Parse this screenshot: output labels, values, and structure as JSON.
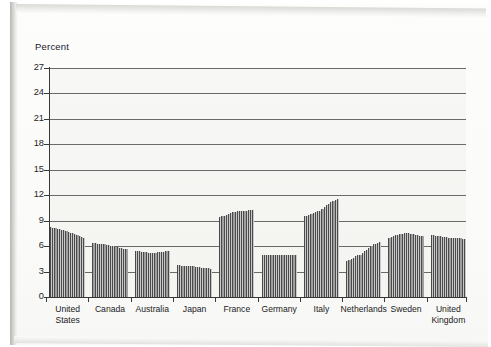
{
  "chart_data": {
    "type": "bar",
    "title": "",
    "subtitle": "",
    "xlabel": "",
    "ylabel": "Percent",
    "ylim": [
      0,
      27
    ],
    "yticks": [
      0,
      3,
      6,
      9,
      12,
      15,
      18,
      21,
      24,
      27
    ],
    "grid": true,
    "legend": false,
    "legend_position": "none",
    "note": "Grouped time-series bars: each country group is a run of thin bars showing a trend over consecutive periods.",
    "categories": [
      "United States",
      "Canada",
      "Australia",
      "Japan",
      "France",
      "Germany",
      "Italy",
      "Netherlands",
      "Sweden",
      "United Kingdom"
    ],
    "groups": [
      {
        "label": "United States",
        "values": [
          8.2,
          8.1,
          8.1,
          8.0,
          8.0,
          7.9,
          7.9,
          7.8,
          7.7,
          7.6,
          7.5,
          7.4,
          7.3,
          7.2,
          7.1,
          7.0
        ]
      },
      {
        "label": "Canada",
        "values": [
          6.4,
          6.4,
          6.3,
          6.3,
          6.2,
          6.2,
          6.1,
          6.1,
          6.0,
          6.0,
          5.9,
          5.9,
          5.8,
          5.8,
          5.7,
          5.7
        ]
      },
      {
        "label": "Australia",
        "values": [
          5.4,
          5.4,
          5.4,
          5.3,
          5.3,
          5.3,
          5.2,
          5.2,
          5.2,
          5.2,
          5.3,
          5.3,
          5.3,
          5.3,
          5.4,
          5.4
        ]
      },
      {
        "label": "Japan",
        "values": [
          3.8,
          3.8,
          3.7,
          3.7,
          3.7,
          3.6,
          3.6,
          3.6,
          3.5,
          3.5,
          3.5,
          3.4,
          3.4,
          3.4,
          3.4,
          3.3
        ]
      },
      {
        "label": "France",
        "values": [
          9.4,
          9.5,
          9.6,
          9.7,
          9.8,
          9.9,
          10.0,
          10.0,
          10.1,
          10.1,
          10.2,
          10.2,
          10.2,
          10.3,
          10.3,
          10.3
        ]
      },
      {
        "label": "Germany",
        "values": [
          5.0,
          5.0,
          5.0,
          5.0,
          5.0,
          5.0,
          5.0,
          5.0,
          5.0,
          5.0,
          5.0,
          5.0,
          5.0,
          5.0,
          5.0,
          5.0
        ]
      },
      {
        "label": "Italy",
        "values": [
          9.5,
          9.6,
          9.7,
          9.8,
          9.9,
          10.0,
          10.1,
          10.2,
          10.4,
          10.6,
          10.8,
          11.0,
          11.2,
          11.3,
          11.4,
          11.5
        ]
      },
      {
        "label": "Netherlands",
        "values": [
          4.3,
          4.4,
          4.5,
          4.6,
          4.8,
          4.9,
          5.0,
          5.2,
          5.4,
          5.6,
          5.8,
          6.0,
          6.2,
          6.3,
          6.4,
          6.5
        ]
      },
      {
        "label": "Sweden",
        "values": [
          7.0,
          7.1,
          7.2,
          7.3,
          7.3,
          7.4,
          7.4,
          7.5,
          7.5,
          7.5,
          7.4,
          7.4,
          7.3,
          7.3,
          7.2,
          7.2
        ]
      },
      {
        "label": "United Kingdom",
        "values": [
          7.3,
          7.3,
          7.2,
          7.2,
          7.2,
          7.1,
          7.1,
          7.1,
          7.0,
          7.0,
          7.0,
          6.9,
          6.9,
          6.9,
          6.8,
          6.8
        ]
      }
    ]
  },
  "axis": {
    "y_title": "Percent",
    "y_tick_labels": [
      "27",
      "24",
      "21",
      "18",
      "15",
      "12",
      "9",
      "6",
      "3",
      "0"
    ]
  }
}
